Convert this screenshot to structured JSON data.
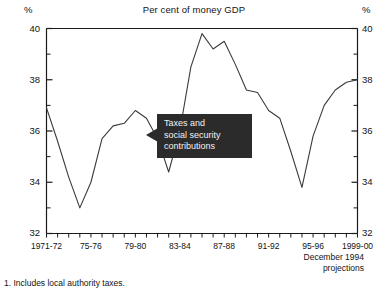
{
  "chart_data": {
    "type": "line",
    "title": "Per cent of money GDP",
    "xlabel": "",
    "ylabel": "%",
    "ylabel_right": "%",
    "ylim": [
      32,
      40
    ],
    "yticks": [
      32,
      34,
      36,
      38,
      40
    ],
    "yticks_minor": [
      33,
      35,
      37,
      39
    ],
    "grid": false,
    "legend": "none",
    "series_name": "Taxes and social security contributions",
    "x_tick_labels": [
      "1971-72",
      "75-76",
      "79-80",
      "83-84",
      "87-88",
      "91-92",
      "95-96",
      "1999-00"
    ],
    "x": [
      "1971-72",
      "1972-73",
      "1973-74",
      "1974-75",
      "1975-76",
      "1976-77",
      "1977-78",
      "1978-79",
      "1979-80",
      "1980-81",
      "1981-82",
      "1982-83",
      "1983-84",
      "1984-85",
      "1985-86",
      "1986-87",
      "1987-88",
      "1988-89",
      "1989-90",
      "1990-91",
      "1991-92",
      "1992-93",
      "1993-94",
      "1994-95",
      "1995-96",
      "1996-97",
      "1997-98",
      "1998-99",
      "1999-00"
    ],
    "values": [
      36.9,
      35.6,
      34.2,
      33.0,
      34.0,
      35.7,
      36.2,
      36.3,
      36.8,
      36.5,
      35.7,
      34.4,
      36.0,
      38.5,
      39.8,
      39.2,
      39.5,
      38.6,
      37.6,
      37.5,
      36.8,
      36.5,
      35.2,
      33.8,
      35.8,
      37.0,
      37.6,
      37.9,
      38.0
    ],
    "annotations": [
      {
        "text_lines": [
          "Taxes and",
          "social security",
          "contributions"
        ],
        "style": "black-box-with-left-arrow"
      },
      {
        "text_lines": [
          "December 1994",
          "projections"
        ],
        "style": "plain-right-aligned"
      }
    ],
    "footnote": "1.  Includes local authority taxes."
  },
  "chart": {
    "title": "Per cent of money GDP",
    "axis_unit_left": "%",
    "axis_unit_right": "%",
    "y_labels": [
      "40",
      "38",
      "36",
      "34",
      "32"
    ],
    "y_labels_right": [
      "40",
      "38",
      "36",
      "34",
      "32"
    ],
    "x_labels": [
      "1971-72",
      "75-76",
      "79-80",
      "83-84",
      "87-88",
      "91-92",
      "95-96",
      "1999-00"
    ],
    "callout_line_1": "Taxes and",
    "callout_line_2": "social security",
    "callout_line_3": "contributions",
    "projection_line_1": "December 1994",
    "projection_line_2": "projections",
    "footnote": "1.  Includes local authority taxes.",
    "line_color": "#3a3a3a",
    "axis_color": "#1a1a1a",
    "callout_bg": "#2b2b2b",
    "callout_fg": "#f2f2f2"
  }
}
